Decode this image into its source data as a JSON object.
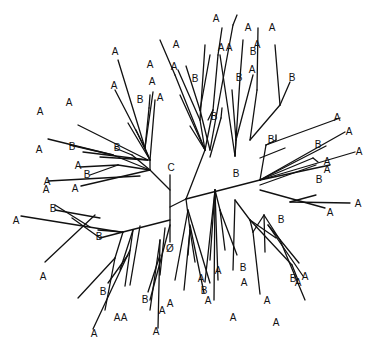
{
  "diagram": {
    "type": "unrooted-tree",
    "line_color": "#111111",
    "background": "#ffffff",
    "special_labels": [
      {
        "text": "C",
        "x": 171,
        "y": 168
      },
      {
        "text": "Ø",
        "x": 170,
        "y": 249
      }
    ],
    "edges": [
      [
        170,
        175,
        170,
        242
      ],
      [
        170,
        207,
        186,
        199
      ],
      [
        186,
        199,
        260,
        180
      ],
      [
        170,
        220,
        123,
        232
      ],
      [
        123,
        232,
        100,
        238
      ],
      [
        170,
        190,
        150,
        170
      ],
      [
        150,
        170,
        150,
        160
      ],
      [
        150,
        160,
        128,
        123
      ],
      [
        150,
        160,
        136,
        130
      ],
      [
        150,
        170,
        113,
        155
      ],
      [
        113,
        155,
        48,
        139
      ],
      [
        113,
        155,
        70,
        145
      ],
      [
        150,
        170,
        118,
        165
      ],
      [
        118,
        165,
        80,
        167
      ],
      [
        118,
        165,
        90,
        175
      ],
      [
        140,
        176,
        48,
        181
      ],
      [
        150,
        170,
        132,
        155
      ],
      [
        132,
        155,
        115,
        148
      ],
      [
        148,
        160,
        100,
        157
      ],
      [
        148,
        160,
        83,
        152
      ],
      [
        148,
        160,
        78,
        125
      ],
      [
        150,
        170,
        81,
        186
      ],
      [
        150,
        160,
        145,
        148
      ],
      [
        145,
        148,
        115,
        90
      ],
      [
        145,
        148,
        149,
        108
      ],
      [
        145,
        148,
        118,
        60
      ],
      [
        145,
        148,
        153,
        92
      ],
      [
        149,
        108,
        150,
        95
      ],
      [
        150,
        160,
        155,
        100
      ],
      [
        186,
        199,
        205,
        150
      ],
      [
        205,
        150,
        190,
        126
      ],
      [
        205,
        150,
        175,
        75
      ],
      [
        175,
        75,
        160,
        40
      ],
      [
        205,
        150,
        200,
        120
      ],
      [
        200,
        120,
        178,
        70
      ],
      [
        200,
        120,
        205,
        45
      ],
      [
        205,
        150,
        213,
        110
      ],
      [
        213,
        110,
        218,
        55
      ],
      [
        218,
        55,
        222,
        28
      ],
      [
        213,
        110,
        208,
        120
      ],
      [
        205,
        150,
        180,
        95
      ],
      [
        210,
        150,
        200,
        110
      ],
      [
        200,
        110,
        186,
        66
      ],
      [
        200,
        110,
        210,
        55
      ],
      [
        210,
        150,
        233,
        25
      ],
      [
        233,
        25,
        237,
        15
      ],
      [
        210,
        157,
        221,
        118
      ],
      [
        221,
        118,
        222,
        108
      ],
      [
        235,
        156,
        240,
        78
      ],
      [
        240,
        78,
        243,
        40
      ],
      [
        235,
        156,
        220,
        55
      ],
      [
        235,
        156,
        236,
        140
      ],
      [
        236,
        140,
        232,
        90
      ],
      [
        236,
        140,
        253,
        75
      ],
      [
        250,
        140,
        257,
        90
      ],
      [
        257,
        90,
        258,
        28
      ],
      [
        250,
        140,
        280,
        105
      ],
      [
        280,
        105,
        275,
        45
      ],
      [
        280,
        105,
        290,
        82
      ],
      [
        260,
        180,
        266,
        145
      ],
      [
        266,
        145,
        340,
        118
      ],
      [
        266,
        145,
        276,
        140
      ],
      [
        276,
        140,
        276,
        135
      ],
      [
        260,
        158,
        285,
        148
      ],
      [
        260,
        180,
        345,
        132
      ],
      [
        260,
        180,
        326,
        146
      ],
      [
        260,
        180,
        355,
        152
      ],
      [
        260,
        180,
        313,
        158
      ],
      [
        313,
        158,
        318,
        162
      ],
      [
        260,
        180,
        330,
        165
      ],
      [
        260,
        185,
        316,
        165
      ],
      [
        290,
        202,
        316,
        195
      ],
      [
        260,
        190,
        325,
        208
      ],
      [
        290,
        202,
        350,
        203
      ],
      [
        235,
        200,
        233,
        270
      ],
      [
        235,
        200,
        250,
        220
      ],
      [
        250,
        220,
        276,
        238
      ],
      [
        250,
        220,
        253,
        232
      ],
      [
        253,
        232,
        260,
        294
      ],
      [
        250,
        220,
        292,
        265
      ],
      [
        292,
        265,
        298,
        280
      ],
      [
        253,
        232,
        264,
        215
      ],
      [
        264,
        215,
        265,
        252
      ],
      [
        264,
        215,
        280,
        240
      ],
      [
        280,
        240,
        305,
        300
      ],
      [
        268,
        225,
        299,
        263
      ],
      [
        268,
        225,
        303,
        276
      ],
      [
        215,
        190,
        210,
        260
      ],
      [
        215,
        190,
        220,
        210
      ],
      [
        220,
        210,
        225,
        250
      ],
      [
        220,
        210,
        237,
        255
      ],
      [
        215,
        190,
        214,
        300
      ],
      [
        215,
        190,
        205,
        282
      ],
      [
        215,
        190,
        218,
        280
      ],
      [
        186,
        199,
        190,
        230
      ],
      [
        190,
        230,
        195,
        262
      ],
      [
        190,
        230,
        188,
        255
      ],
      [
        190,
        230,
        184,
        290
      ],
      [
        190,
        225,
        204,
        293
      ],
      [
        188,
        210,
        210,
        283
      ],
      [
        188,
        210,
        175,
        280
      ],
      [
        170,
        225,
        150,
        300
      ],
      [
        165,
        228,
        160,
        275
      ],
      [
        160,
        240,
        150,
        310
      ],
      [
        160,
        240,
        158,
        328
      ],
      [
        160,
        255,
        148,
        292
      ],
      [
        140,
        226,
        130,
        285
      ],
      [
        133,
        230,
        125,
        286
      ],
      [
        133,
        230,
        120,
        270
      ],
      [
        130,
        250,
        93,
        329
      ],
      [
        128,
        255,
        108,
        283
      ],
      [
        123,
        232,
        115,
        258
      ],
      [
        115,
        258,
        78,
        298
      ],
      [
        115,
        258,
        105,
        310
      ],
      [
        123,
        232,
        98,
        230
      ],
      [
        100,
        238,
        72,
        218
      ],
      [
        100,
        218,
        55,
        210
      ],
      [
        120,
        232,
        21,
        216
      ],
      [
        90,
        227,
        55,
        205
      ],
      [
        95,
        215,
        45,
        262
      ]
    ],
    "leaves": [
      {
        "text": "A",
        "x": 216,
        "y": 19
      },
      {
        "text": "A",
        "x": 248,
        "y": 28
      },
      {
        "text": "A",
        "x": 272,
        "y": 28
      },
      {
        "text": "A",
        "x": 221,
        "y": 48
      },
      {
        "text": "A",
        "x": 229,
        "y": 48
      },
      {
        "text": "A",
        "x": 257,
        "y": 45
      },
      {
        "text": "A",
        "x": 176,
        "y": 45
      },
      {
        "text": "A",
        "x": 115,
        "y": 52
      },
      {
        "text": "A",
        "x": 150,
        "y": 65
      },
      {
        "text": "A",
        "x": 174,
        "y": 67
      },
      {
        "text": "A",
        "x": 252,
        "y": 70
      },
      {
        "text": "A",
        "x": 114,
        "y": 86
      },
      {
        "text": "A",
        "x": 152,
        "y": 82
      },
      {
        "text": "A",
        "x": 160,
        "y": 98
      },
      {
        "text": "A",
        "x": 69,
        "y": 103
      },
      {
        "text": "A",
        "x": 40,
        "y": 112
      },
      {
        "text": "A",
        "x": 39,
        "y": 150
      },
      {
        "text": "A",
        "x": 78,
        "y": 166
      },
      {
        "text": "A",
        "x": 47,
        "y": 182
      },
      {
        "text": "A",
        "x": 46,
        "y": 190
      },
      {
        "text": "A",
        "x": 75,
        "y": 189
      },
      {
        "text": "A",
        "x": 16,
        "y": 221
      },
      {
        "text": "A",
        "x": 43,
        "y": 277
      },
      {
        "text": "A",
        "x": 337,
        "y": 118
      },
      {
        "text": "A",
        "x": 349,
        "y": 132
      },
      {
        "text": "A",
        "x": 359,
        "y": 152
      },
      {
        "text": "A",
        "x": 327,
        "y": 162
      },
      {
        "text": "A",
        "x": 327,
        "y": 170
      },
      {
        "text": "A",
        "x": 358,
        "y": 204
      },
      {
        "text": "A",
        "x": 330,
        "y": 213
      },
      {
        "text": "A",
        "x": 298,
        "y": 283
      },
      {
        "text": "A",
        "x": 305,
        "y": 277
      },
      {
        "text": "A",
        "x": 267,
        "y": 301
      },
      {
        "text": "A",
        "x": 276,
        "y": 323
      },
      {
        "text": "A",
        "x": 218,
        "y": 271
      },
      {
        "text": "A",
        "x": 244,
        "y": 283
      },
      {
        "text": "A",
        "x": 208,
        "y": 301
      },
      {
        "text": "A",
        "x": 201,
        "y": 279
      },
      {
        "text": "A",
        "x": 233,
        "y": 318
      },
      {
        "text": "A",
        "x": 170,
        "y": 304
      },
      {
        "text": "A",
        "x": 162,
        "y": 311
      },
      {
        "text": "A",
        "x": 156,
        "y": 332
      },
      {
        "text": "A",
        "x": 117,
        "y": 318
      },
      {
        "text": "A",
        "x": 124,
        "y": 318
      },
      {
        "text": "A",
        "x": 94,
        "y": 334
      }
    ],
    "internal_labels": [
      {
        "text": "B",
        "x": 214,
        "y": 117
      },
      {
        "text": "B",
        "x": 195,
        "y": 79
      },
      {
        "text": "B",
        "x": 140,
        "y": 100
      },
      {
        "text": "B",
        "x": 72,
        "y": 147
      },
      {
        "text": "B",
        "x": 117,
        "y": 148
      },
      {
        "text": "B",
        "x": 87,
        "y": 175
      },
      {
        "text": "B",
        "x": 53,
        "y": 209
      },
      {
        "text": "B",
        "x": 99,
        "y": 237
      },
      {
        "text": "B",
        "x": 239,
        "y": 78
      },
      {
        "text": "B",
        "x": 253,
        "y": 52
      },
      {
        "text": "B",
        "x": 292,
        "y": 78
      },
      {
        "text": "B",
        "x": 271,
        "y": 140
      },
      {
        "text": "B",
        "x": 318,
        "y": 145
      },
      {
        "text": "B",
        "x": 236,
        "y": 174
      },
      {
        "text": "B",
        "x": 319,
        "y": 180
      },
      {
        "text": "B",
        "x": 281,
        "y": 220
      },
      {
        "text": "B",
        "x": 293,
        "y": 279
      },
      {
        "text": "B",
        "x": 243,
        "y": 268
      },
      {
        "text": "B",
        "x": 204,
        "y": 291
      },
      {
        "text": "B",
        "x": 145,
        "y": 300
      },
      {
        "text": "B",
        "x": 103,
        "y": 292
      }
    ]
  }
}
